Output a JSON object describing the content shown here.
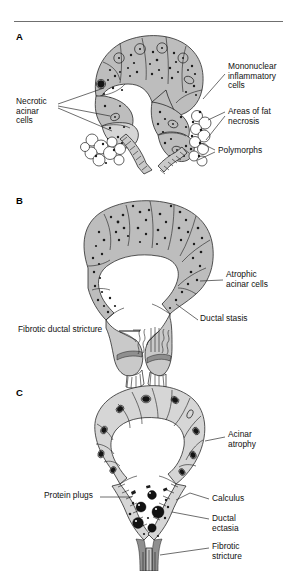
{
  "figure": {
    "top_rule": true,
    "background_color": "#ffffff",
    "ink_color": "#1a1a1a",
    "cell_fill_color": "#b8b8b8",
    "cell_fill_light": "#d0d0d0",
    "fat_necrosis_fill": "#ffffff",
    "calculus_color": "#111111",
    "stricture_band_color": "#8c8c8c"
  },
  "panels": [
    {
      "letter": "A",
      "name": "acute-pancreatitis",
      "labels": [
        {
          "id": "necrotic-acinar-cells",
          "text": "Necrotic\nacinar\ncells",
          "align": "left",
          "x": 16,
          "y": 97,
          "leaders": 3
        },
        {
          "id": "mononuclear-inflammatory-cells",
          "text": "Mononuclear\ninflammatory\ncells",
          "align": "left",
          "x": 228,
          "y": 62,
          "leaders": 1
        },
        {
          "id": "areas-of-fat-necrosis",
          "text": "Areas of fat\nnecrosis",
          "align": "left",
          "x": 228,
          "y": 107,
          "leaders": 2
        },
        {
          "id": "polymorphs",
          "text": "Polymorphs",
          "align": "left",
          "x": 218,
          "y": 147,
          "leaders": 2
        }
      ]
    },
    {
      "letter": "B",
      "name": "chronic-pancreatitis-atrophy",
      "labels": [
        {
          "id": "atrophic-acinar-cells",
          "text": "Atrophic\nacinar cells",
          "align": "left",
          "x": 226,
          "y": 272,
          "leaders": 1
        },
        {
          "id": "ductal-stasis",
          "text": "Ductal stasis",
          "align": "left",
          "x": 200,
          "y": 316,
          "leaders": 1
        },
        {
          "id": "fibrotic-ductal-stricture",
          "text": "Fibrotic ductal stricture",
          "align": "left",
          "x": 22,
          "y": 327,
          "leaders": 1
        }
      ]
    },
    {
      "letter": "C",
      "name": "chronic-pancreatitis-calculi",
      "labels": [
        {
          "id": "acinar-atrophy",
          "text": "Acinar\natrophy",
          "align": "left",
          "x": 228,
          "y": 431,
          "leaders": 1
        },
        {
          "id": "protein-plugs",
          "text": "Protein plugs",
          "align": "left",
          "x": 46,
          "y": 492,
          "leaders": 1
        },
        {
          "id": "calculus",
          "text": "Calculus",
          "align": "left",
          "x": 212,
          "y": 495,
          "leaders": 1
        },
        {
          "id": "ductal-ectasia",
          "text": "Ductal\nectasia",
          "align": "left",
          "x": 212,
          "y": 516,
          "leaders": 1
        },
        {
          "id": "fibrotic-stricture",
          "text": "Fibrotic\nstricture",
          "align": "left",
          "x": 212,
          "y": 543,
          "leaders": 1
        }
      ]
    }
  ]
}
